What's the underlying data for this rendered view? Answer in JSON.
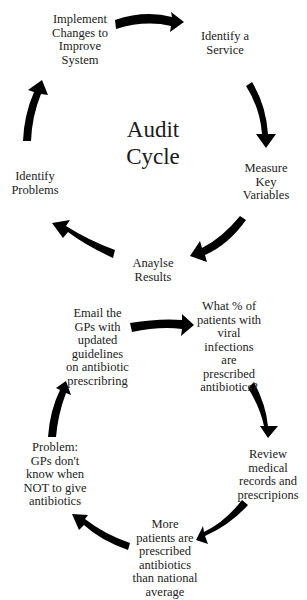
{
  "diagram": {
    "type": "cycle",
    "colors": {
      "arrow": "#000000",
      "text": "#222222",
      "background": "#ffffff"
    }
  },
  "general_cycle": {
    "title": "Audit\nCycle",
    "steps": [
      {
        "id": "identify-service",
        "label": "Identify a\nService"
      },
      {
        "id": "measure-variables",
        "label": "Measure\nKey\nVariables"
      },
      {
        "id": "analyse-results",
        "label": "Anaylse\nResults"
      },
      {
        "id": "identify-problems",
        "label": "Identify\nProblems"
      },
      {
        "id": "implement-changes",
        "label": "Implement\nChanges to\nImprove\nSystem"
      }
    ]
  },
  "example_cycle": {
    "steps": [
      {
        "id": "question",
        "label": "What % of\npatients with\nviral\ninfections\nare\nprescribed\nantibiotics?"
      },
      {
        "id": "review-records",
        "label": "Review\nmedical\nrecords and\nprescripions"
      },
      {
        "id": "finding",
        "label": "More\npatients are\nprescribed\nantibiotics\nthan national\naverage"
      },
      {
        "id": "problem",
        "label": "Problem:\nGPs don't\nknow when\nNOT to give\nantibiotics"
      },
      {
        "id": "action",
        "label": "Email the\nGPs with\nupdated\nguidelines\non antibiotic\nprescribring"
      }
    ]
  }
}
